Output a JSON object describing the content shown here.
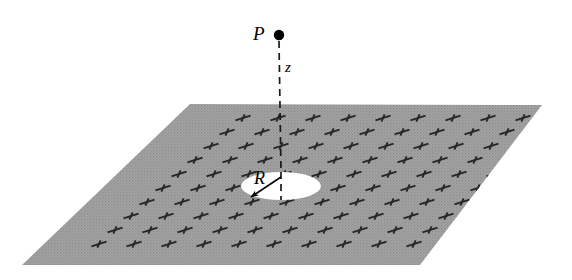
{
  "figure": {
    "background_color": "#ffffff",
    "width": 572,
    "height": 280
  },
  "plane": {
    "name": "charged-sheet",
    "fill_color": "#9a9a9a",
    "texture": "halftone-dots",
    "corners": [
      {
        "x": 190,
        "y": 104
      },
      {
        "x": 542,
        "y": 105
      },
      {
        "x": 420,
        "y": 265
      },
      {
        "x": 22,
        "y": 265
      }
    ]
  },
  "hole": {
    "name": "circular-hole",
    "fill_color": "#ffffff",
    "center": {
      "x": 281,
      "y": 186
    },
    "radius_x": 40,
    "radius_y": 14
  },
  "point_P": {
    "label": "P",
    "dot_color": "#000000",
    "center": {
      "x": 279,
      "y": 35
    },
    "radius": 5.2
  },
  "axis_line": {
    "name": "z-axis-dashed-line",
    "label": "z",
    "color": "#1a1a1a",
    "dash_pattern": "7 5",
    "from": {
      "x": 279,
      "y": 41
    },
    "to": {
      "x": 281,
      "y": 200
    }
  },
  "radius_arrow": {
    "label": "R",
    "color": "#000000",
    "from": {
      "x": 281,
      "y": 177
    },
    "to": {
      "x": 249,
      "y": 198
    }
  },
  "charges": {
    "symbol": "+",
    "color": "#262626",
    "description": "sheared plus signs marking uniform positive surface charge",
    "rows": [
      {
        "y": 174,
        "x_start": 179,
        "count": 10,
        "x_step": 35
      },
      {
        "y": 160,
        "x_start": 195,
        "count": 10,
        "x_step": 35
      },
      {
        "y": 146,
        "x_start": 211,
        "count": 10,
        "x_step": 35
      },
      {
        "y": 132,
        "x_start": 227,
        "count": 10,
        "x_step": 35
      },
      {
        "y": 118,
        "x_start": 243,
        "count": 9,
        "x_step": 35
      },
      {
        "y": 188,
        "x_start": 163,
        "count": 10,
        "x_step": 35
      },
      {
        "y": 202,
        "x_start": 147,
        "count": 10,
        "x_step": 35
      },
      {
        "y": 216,
        "x_start": 131,
        "count": 10,
        "x_step": 35
      },
      {
        "y": 230,
        "x_start": 115,
        "count": 10,
        "x_step": 35
      },
      {
        "y": 244,
        "x_start": 99,
        "count": 10,
        "x_step": 35
      }
    ]
  }
}
